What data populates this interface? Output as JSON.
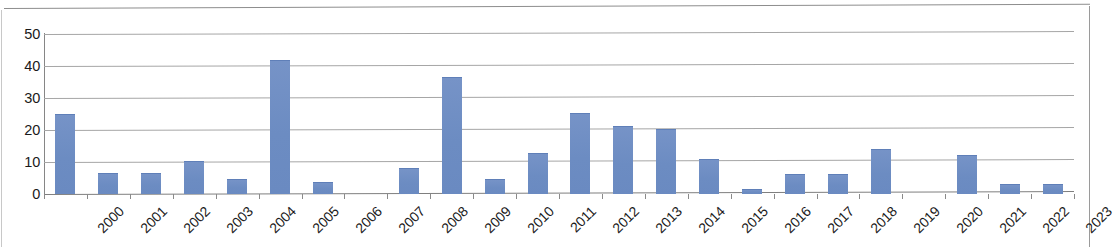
{
  "chart_data": {
    "type": "bar",
    "title": "",
    "subtitle": "",
    "xlabel": "",
    "ylabel": "",
    "ylim": [
      0,
      50
    ],
    "ytick_labels": [
      "50",
      "40",
      "30",
      "20",
      "10",
      "0"
    ],
    "ytick_values": [
      50,
      40,
      30,
      20,
      10,
      0
    ],
    "grid": true,
    "legend": "none",
    "bar_color": "#6e8fc4",
    "gridline_color": "#a6a6a6",
    "axis_color": "#868686",
    "categories": [
      "2000",
      "2001",
      "2002",
      "2003",
      "2004",
      "2005",
      "2006",
      "2007",
      "2008",
      "2009",
      "2010",
      "2011",
      "2012",
      "2013",
      "2014",
      "2015",
      "2016",
      "2017",
      "2018",
      "2019",
      "2020",
      "2021",
      "2022",
      "2023"
    ],
    "values": [
      25,
      6.5,
      6.5,
      10.2,
      4.6,
      42,
      3.7,
      0,
      8,
      36.5,
      4.8,
      12.7,
      25.4,
      21.3,
      20.2,
      11,
      1.5,
      6.2,
      6.3,
      14.2,
      0,
      12.2,
      3.1,
      3.2
    ],
    "series": [
      {
        "name": "",
        "values": [
          25,
          6.5,
          6.5,
          10.2,
          4.6,
          42,
          3.7,
          0,
          8,
          36.5,
          4.8,
          12.7,
          25.4,
          21.3,
          20.2,
          11,
          1.5,
          6.2,
          6.3,
          14.2,
          0,
          12.2,
          3.1,
          3.2
        ]
      }
    ]
  }
}
